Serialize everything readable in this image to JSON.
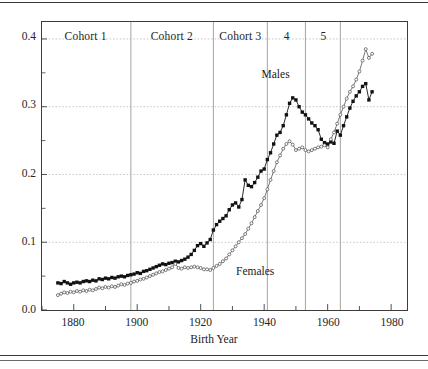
{
  "chart_data": {
    "type": "line",
    "title": "",
    "xlabel": "Birth Year",
    "ylabel": "",
    "xlim": [
      1870,
      1985
    ],
    "ylim": [
      0.0,
      0.425
    ],
    "grid": true,
    "legend_position": "inline-annotation",
    "xticks": [
      "1880",
      "1900",
      "1920",
      "1940",
      "1960",
      "1980"
    ],
    "xtick_values": [
      1880,
      1900,
      1920,
      1940,
      1960,
      1980
    ],
    "yticks": [
      "0.0",
      "0.1",
      "0.2",
      "0.3",
      "0.4"
    ],
    "ytick_values": [
      0.0,
      0.1,
      0.2,
      0.3,
      0.4
    ],
    "minor_yticks": [
      0.05,
      0.15,
      0.25,
      0.35
    ],
    "annotations": [
      {
        "text": "Males",
        "x": 1946,
        "y": 0.345
      },
      {
        "text": "Females",
        "x": 1938,
        "y": 0.055
      }
    ],
    "cohort_bands": [
      {
        "label": "Cohort 1",
        "start": 1870,
        "end": 1898
      },
      {
        "label": "Cohort 2",
        "start": 1898,
        "end": 1924
      },
      {
        "label": "Cohort 3",
        "start": 1924,
        "end": 1941
      },
      {
        "label": "4",
        "start": 1941,
        "end": 1953
      },
      {
        "label": "5",
        "start": 1953,
        "end": 1964
      }
    ],
    "series": [
      {
        "name": "Males",
        "marker": "filled-square",
        "color": "#111111",
        "x": [
          1875,
          1876,
          1877,
          1878,
          1879,
          1880,
          1881,
          1882,
          1883,
          1884,
          1885,
          1886,
          1887,
          1888,
          1889,
          1890,
          1891,
          1892,
          1893,
          1894,
          1895,
          1896,
          1897,
          1898,
          1899,
          1900,
          1901,
          1902,
          1903,
          1904,
          1905,
          1906,
          1907,
          1908,
          1909,
          1910,
          1911,
          1912,
          1913,
          1914,
          1915,
          1916,
          1917,
          1918,
          1919,
          1920,
          1921,
          1922,
          1923,
          1924,
          1925,
          1926,
          1927,
          1928,
          1929,
          1930,
          1931,
          1932,
          1933,
          1934,
          1935,
          1936,
          1937,
          1938,
          1939,
          1940,
          1941,
          1942,
          1943,
          1944,
          1945,
          1946,
          1947,
          1948,
          1949,
          1950,
          1951,
          1952,
          1953,
          1954,
          1955,
          1956,
          1957,
          1958,
          1959,
          1960,
          1961,
          1962,
          1963,
          1964,
          1965,
          1966,
          1967,
          1968,
          1969,
          1970,
          1971,
          1972,
          1973,
          1974
        ],
        "values": [
          0.04,
          0.039,
          0.042,
          0.04,
          0.038,
          0.04,
          0.041,
          0.04,
          0.042,
          0.043,
          0.042,
          0.044,
          0.043,
          0.046,
          0.045,
          0.047,
          0.046,
          0.048,
          0.047,
          0.049,
          0.05,
          0.049,
          0.051,
          0.052,
          0.053,
          0.055,
          0.054,
          0.057,
          0.058,
          0.06,
          0.062,
          0.064,
          0.066,
          0.068,
          0.067,
          0.069,
          0.07,
          0.072,
          0.071,
          0.073,
          0.075,
          0.078,
          0.082,
          0.088,
          0.095,
          0.098,
          0.094,
          0.099,
          0.104,
          0.118,
          0.126,
          0.131,
          0.135,
          0.139,
          0.148,
          0.155,
          0.158,
          0.152,
          0.163,
          0.192,
          0.184,
          0.182,
          0.188,
          0.196,
          0.205,
          0.208,
          0.222,
          0.232,
          0.245,
          0.258,
          0.262,
          0.272,
          0.288,
          0.305,
          0.313,
          0.31,
          0.3,
          0.292,
          0.288,
          0.282,
          0.276,
          0.272,
          0.266,
          0.252,
          0.247,
          0.245,
          0.248,
          0.246,
          0.264,
          0.258,
          0.272,
          0.285,
          0.298,
          0.308,
          0.316,
          0.322,
          0.33,
          0.334,
          0.31,
          0.322
        ]
      },
      {
        "name": "Females",
        "marker": "open-circle",
        "color": "#6e6e6e",
        "x": [
          1875,
          1876,
          1877,
          1878,
          1879,
          1880,
          1881,
          1882,
          1883,
          1884,
          1885,
          1886,
          1887,
          1888,
          1889,
          1890,
          1891,
          1892,
          1893,
          1894,
          1895,
          1896,
          1897,
          1898,
          1899,
          1900,
          1901,
          1902,
          1903,
          1904,
          1905,
          1906,
          1907,
          1908,
          1909,
          1910,
          1911,
          1912,
          1913,
          1914,
          1915,
          1916,
          1917,
          1918,
          1919,
          1920,
          1921,
          1922,
          1923,
          1924,
          1925,
          1926,
          1927,
          1928,
          1929,
          1930,
          1931,
          1932,
          1933,
          1934,
          1935,
          1936,
          1937,
          1938,
          1939,
          1940,
          1941,
          1942,
          1943,
          1944,
          1945,
          1946,
          1947,
          1948,
          1949,
          1950,
          1951,
          1952,
          1953,
          1954,
          1955,
          1956,
          1957,
          1958,
          1959,
          1960,
          1961,
          1962,
          1963,
          1964,
          1965,
          1966,
          1967,
          1968,
          1969,
          1970,
          1971,
          1972,
          1973,
          1974
        ],
        "values": [
          0.022,
          0.024,
          0.026,
          0.025,
          0.027,
          0.026,
          0.028,
          0.027,
          0.029,
          0.028,
          0.03,
          0.029,
          0.031,
          0.033,
          0.032,
          0.034,
          0.033,
          0.035,
          0.034,
          0.036,
          0.038,
          0.037,
          0.039,
          0.04,
          0.042,
          0.043,
          0.045,
          0.046,
          0.048,
          0.05,
          0.052,
          0.054,
          0.056,
          0.057,
          0.059,
          0.061,
          0.063,
          0.068,
          0.062,
          0.061,
          0.063,
          0.062,
          0.063,
          0.064,
          0.063,
          0.062,
          0.06,
          0.06,
          0.059,
          0.062,
          0.065,
          0.068,
          0.072,
          0.076,
          0.082,
          0.088,
          0.094,
          0.1,
          0.106,
          0.112,
          0.12,
          0.128,
          0.137,
          0.146,
          0.155,
          0.165,
          0.178,
          0.192,
          0.205,
          0.218,
          0.228,
          0.238,
          0.245,
          0.249,
          0.244,
          0.236,
          0.238,
          0.24,
          0.236,
          0.234,
          0.236,
          0.238,
          0.24,
          0.241,
          0.243,
          0.24,
          0.252,
          0.262,
          0.275,
          0.288,
          0.3,
          0.312,
          0.322,
          0.33,
          0.34,
          0.352,
          0.368,
          0.385,
          0.372,
          0.378
        ]
      }
    ]
  }
}
